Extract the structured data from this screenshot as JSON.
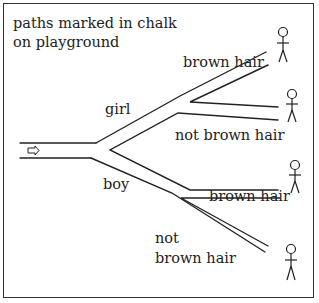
{
  "title_line1": "paths marked in chalk",
  "title_line2": "on playground",
  "labels": {
    "girl": "girl",
    "boy": "boy",
    "girl_brown": "brown hair",
    "girl_not_brown": "not brown hair",
    "boy_brown": "brown hair",
    "boy_not_brown_1": "not",
    "boy_not_brown_2": "brown hair"
  },
  "entry_icon": "right-arrow-icon",
  "figures": [
    "stick-figure-girl-brown-hair",
    "stick-figure-girl-not-brown-hair",
    "stick-figure-boy-brown-hair",
    "stick-figure-boy-not-brown-hair"
  ],
  "colors": {
    "ink": "#222222",
    "background": "#ffffff"
  }
}
